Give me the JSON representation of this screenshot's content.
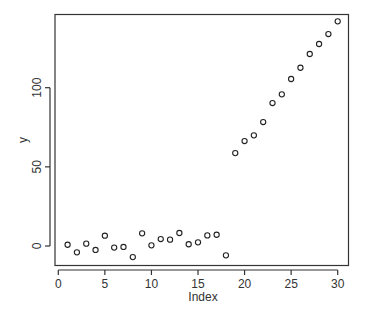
{
  "chart_data": {
    "type": "scatter",
    "title": "",
    "xlabel": "Index",
    "ylabel": "y",
    "xlim": [
      0,
      31
    ],
    "ylim": [
      -13,
      146
    ],
    "x_ticks": [
      0,
      5,
      10,
      15,
      20,
      25,
      30
    ],
    "x_tick_labels": [
      "0",
      "5",
      "10",
      "15",
      "20",
      "25",
      "30"
    ],
    "y_ticks": [
      0,
      50,
      100
    ],
    "y_tick_labels": [
      "0",
      "50",
      "100"
    ],
    "grid": false,
    "legend": null,
    "marker": "open-circle",
    "color": "#222222",
    "series": [
      {
        "name": "y",
        "x": [
          1,
          2,
          3,
          4,
          5,
          6,
          7,
          8,
          9,
          10,
          11,
          12,
          13,
          14,
          15,
          16,
          17,
          18,
          19,
          20,
          21,
          22,
          23,
          24,
          25,
          26,
          27,
          28,
          29,
          30
        ],
        "y": [
          0.8,
          -4.0,
          1.5,
          -2.5,
          6.5,
          -1.0,
          -0.6,
          -7.0,
          8.0,
          0.4,
          4.4,
          4.0,
          8.2,
          1.1,
          2.3,
          6.7,
          7.1,
          -5.9,
          58.7,
          66.3,
          69.9,
          78.3,
          90.3,
          95.8,
          105.5,
          112.6,
          121.3,
          127.6,
          133.9,
          141.9
        ]
      }
    ]
  }
}
